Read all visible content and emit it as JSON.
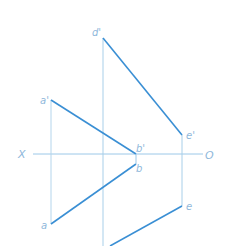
{
  "diagram": {
    "type": "orthographic-projection",
    "colors": {
      "thin_line": "#9cc8e8",
      "thick_line": "#3a8fd4",
      "label": "#8fb8db",
      "background": "#ffffff"
    },
    "axis": {
      "left_label": "X",
      "right_label": "O"
    },
    "points": {
      "d_prime": {
        "label": "d'",
        "x": 103,
        "y": 38
      },
      "e_prime": {
        "label": "e'",
        "x": 182,
        "y": 135
      },
      "a_prime": {
        "label": "a'",
        "x": 51,
        "y": 100
      },
      "b_prime": {
        "label": "b'",
        "x": 136,
        "y": 154
      },
      "b": {
        "label": "b",
        "x": 136,
        "y": 164
      },
      "a": {
        "label": "a",
        "x": 51,
        "y": 224
      },
      "e": {
        "label": "e",
        "x": 182,
        "y": 206
      }
    },
    "segments": [
      {
        "from": "d'",
        "to": "e'",
        "style": "thick"
      },
      {
        "from": "a'",
        "to": "b'",
        "style": "thick"
      },
      {
        "from": "a",
        "to": "b",
        "style": "thick"
      },
      {
        "from": "e",
        "to": "bottom-edge",
        "style": "thick"
      },
      {
        "from": "a'",
        "to": "a",
        "style": "thin"
      },
      {
        "from": "e'",
        "to": "e",
        "style": "thin"
      },
      {
        "from": "d'",
        "to": "bottom-edge",
        "style": "thin"
      },
      {
        "from": "X",
        "to": "O",
        "style": "thin"
      }
    ]
  }
}
